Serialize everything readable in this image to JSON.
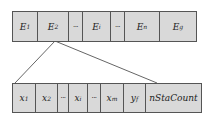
{
  "top_row": {
    "cells": [
      {
        "base": "E",
        "sub": "1",
        "width": 25
      },
      {
        "base": "E",
        "sub": "2",
        "width": 31
      },
      {
        "base": "···",
        "sub": "",
        "width": 14,
        "dots": true
      },
      {
        "base": "E",
        "sub": "i",
        "width": 28
      },
      {
        "base": "···",
        "sub": "",
        "width": 14,
        "dots": true
      },
      {
        "base": "E",
        "sub": "n",
        "width": 35
      },
      {
        "base": "E",
        "sub": "g",
        "width": 36
      }
    ]
  },
  "bottom_row": {
    "cells": [
      {
        "base": "x",
        "sub": "1",
        "width": 23
      },
      {
        "base": "x",
        "sub": "2",
        "width": 22
      },
      {
        "base": "···",
        "sub": "",
        "width": 11,
        "dots": true
      },
      {
        "base": "x",
        "sub": "i",
        "width": 19
      },
      {
        "base": "···",
        "sub": "",
        "width": 13,
        "dots": true
      },
      {
        "base": "x",
        "sub": "m",
        "width": 23
      },
      {
        "base": "y",
        "sub": "f",
        "width": 22
      },
      {
        "base": "nStaCount",
        "sub": "",
        "width": 55
      }
    ]
  },
  "connector": {
    "from": [
      55,
      41
    ],
    "to_left": [
      15,
      83
    ],
    "to_right": [
      157,
      83
    ],
    "color": "#666666"
  }
}
